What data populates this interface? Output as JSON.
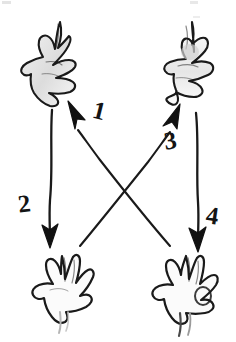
{
  "figure": {
    "background_color": "#ffffff",
    "ink_color": "#1a1a1a",
    "width": 236,
    "height": 342
  },
  "hands": [
    {
      "id": "hand-top-left",
      "position": "top-left",
      "description": "sketched open hand, fingers spread, pointing down-left",
      "x": 24,
      "y": 18,
      "width": 68,
      "height": 78
    },
    {
      "id": "hand-top-right",
      "position": "top-right",
      "description": "sketched open hand, fingers spread, pointing down",
      "x": 172,
      "y": 18,
      "width": 58,
      "height": 80
    },
    {
      "id": "hand-bottom-left",
      "position": "bottom-left",
      "description": "sketched open hand, fingers up, thumb left",
      "x": 26,
      "y": 252,
      "width": 62,
      "height": 80
    },
    {
      "id": "hand-bottom-right",
      "position": "bottom-right",
      "description": "sketched open hand, fingers up, thumb left",
      "x": 152,
      "y": 252,
      "width": 66,
      "height": 84
    }
  ],
  "arrows": [
    {
      "id": "arrow-1",
      "label": "1",
      "from": "hand-bottom-right",
      "to": "hand-top-left",
      "direction": "up-left",
      "x1": 172,
      "y1": 247,
      "x2": 70,
      "y2": 105
    },
    {
      "id": "arrow-2",
      "label": "2",
      "from": "hand-top-left",
      "to": "hand-bottom-left",
      "direction": "down",
      "x1": 52,
      "y1": 110,
      "x2": 50,
      "y2": 243
    },
    {
      "id": "arrow-3",
      "label": "3",
      "from": "hand-bottom-left",
      "to": "hand-top-right",
      "direction": "up-right",
      "x1": 78,
      "y1": 247,
      "x2": 178,
      "y2": 108
    },
    {
      "id": "arrow-4",
      "label": "4",
      "from": "hand-top-right",
      "to": "hand-bottom-right",
      "direction": "down",
      "x1": 197,
      "y1": 113,
      "x2": 198,
      "y2": 245
    }
  ],
  "labels": {
    "one": "1",
    "two": "2",
    "three": "3",
    "four": "4"
  }
}
